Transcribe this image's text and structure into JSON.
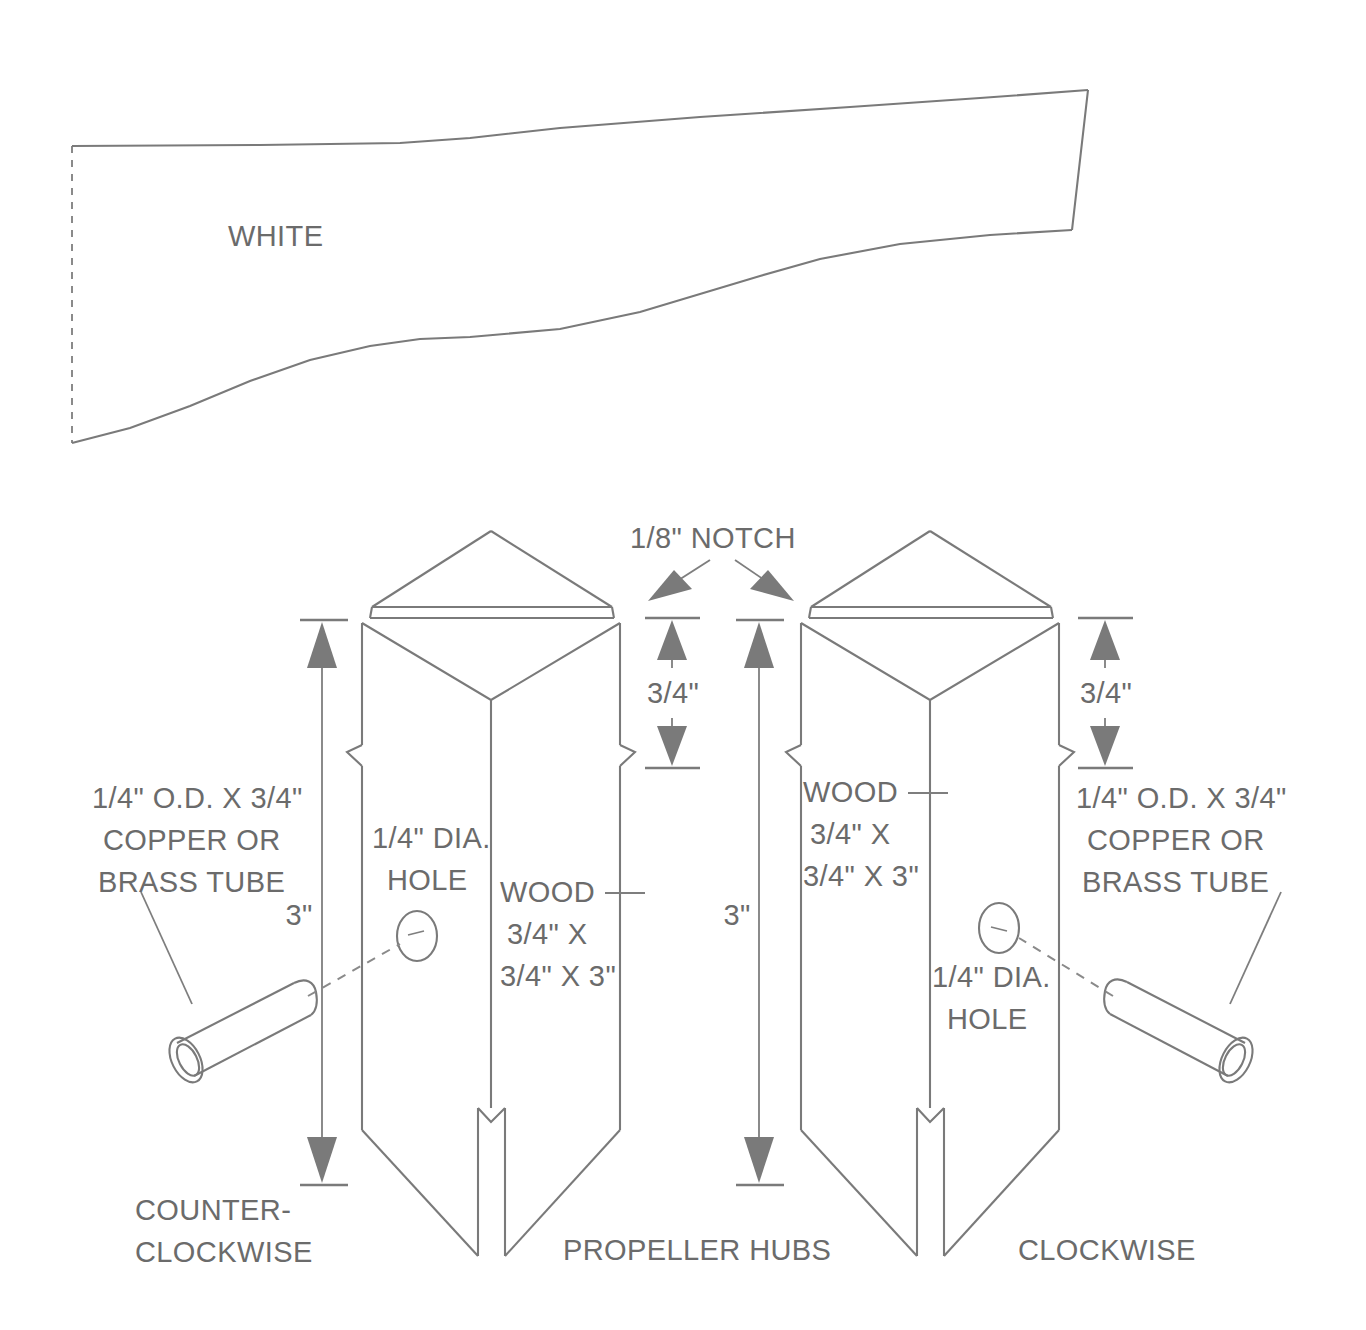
{
  "figure": {
    "line_color": "#7a7a7a",
    "text_color": "#6b6b6b",
    "background": "#ffffff"
  },
  "blade": {
    "label": "WHITE",
    "note": "tapered propeller blade plan outline with dashed root line"
  },
  "callouts": {
    "notch": "1/8\" NOTCH",
    "tube_left_line1": "1/4\" O.D. X 3/4\"",
    "tube_left_line2": "COPPER OR",
    "tube_left_line3": "BRASS TUBE",
    "tube_right_line1": "1/4\" O.D. X 3/4\"",
    "tube_right_line2": "COPPER OR",
    "tube_right_line3": "BRASS TUBE",
    "hole_left_line1": "1/4\" DIA.",
    "hole_left_line2": "HOLE",
    "hole_right_line1": "1/4\" DIA.",
    "hole_right_line2": "HOLE",
    "wood_left_line1": "WOOD",
    "wood_left_line2": "3/4\" X",
    "wood_left_line3": "3/4\" X 3\"",
    "wood_right_line1": "WOOD",
    "wood_right_line2": "3/4\" X",
    "wood_right_line3": "3/4\" X 3\""
  },
  "dimensions": {
    "left_height": "3\"",
    "right_height": "3\"",
    "left_notch_depth": "3/4\"",
    "right_notch_depth": "3/4\""
  },
  "bottom_labels": {
    "left_line1": "COUNTER-",
    "left_line2": "CLOCKWISE",
    "center": "PROPELLER HUBS",
    "right": "CLOCKWISE"
  }
}
